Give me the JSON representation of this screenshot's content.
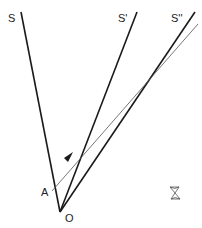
{
  "diagram": {
    "labels": {
      "s": "S",
      "s_prime": "S'",
      "s_double_prime": "S''",
      "a": "A",
      "o": "O"
    },
    "colors": {
      "line": "#1a1a1a",
      "ray": "#555555",
      "text": "#222222"
    }
  }
}
